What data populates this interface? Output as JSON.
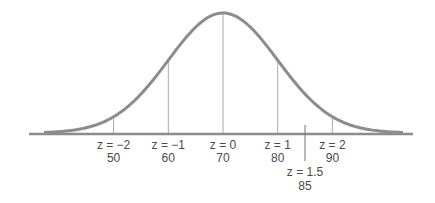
{
  "chart_data": {
    "type": "line",
    "title": "",
    "mean": 70,
    "sd": 10,
    "xlim": [
      35,
      105
    ],
    "colors": {
      "curve": "#8c8c8c",
      "axis": "#8c8c8c",
      "markers": "#a8a8a8",
      "pointer": "#707070",
      "text": "#4a4a4a"
    },
    "markers": [
      {
        "z_label": "z = −2",
        "value_label": "50",
        "z": -2,
        "value": 50
      },
      {
        "z_label": "z = −1",
        "value_label": "60",
        "z": -1,
        "value": 60
      },
      {
        "z_label": "z = 0",
        "value_label": "70",
        "z": 0,
        "value": 70
      },
      {
        "z_label": "z = 1",
        "value_label": "80",
        "z": 1,
        "value": 80
      },
      {
        "z_label": "z = 2",
        "value_label": "90",
        "z": 2,
        "value": 90
      }
    ],
    "highlight": {
      "z_label": "z = 1.5",
      "value_label": "85",
      "z": 1.5,
      "value": 85
    }
  }
}
